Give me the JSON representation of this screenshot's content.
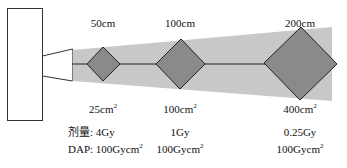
{
  "diagram": {
    "colors": {
      "beam": "#c8c8c8",
      "diamond_fill": "#8a8a8a",
      "outline": "#222222"
    },
    "source": {
      "name": "x-ray-tube"
    },
    "points": [
      {
        "distance": "50cm",
        "area": "25cm",
        "area_sup": "2",
        "dose": "4Gy",
        "dap": "100Gycm",
        "dap_sup": "2"
      },
      {
        "distance": "100cm",
        "area": "100cm",
        "area_sup": "2",
        "dose": "1Gy",
        "dap": "100Gycm",
        "dap_sup": "2"
      },
      {
        "distance": "200cm",
        "area": "400cm",
        "area_sup": "2",
        "dose": "0.25Gy",
        "dap": "100Gycm",
        "dap_sup": "2"
      }
    ],
    "dose_prefix": "剂量: ",
    "dap_prefix": "DAP: "
  }
}
